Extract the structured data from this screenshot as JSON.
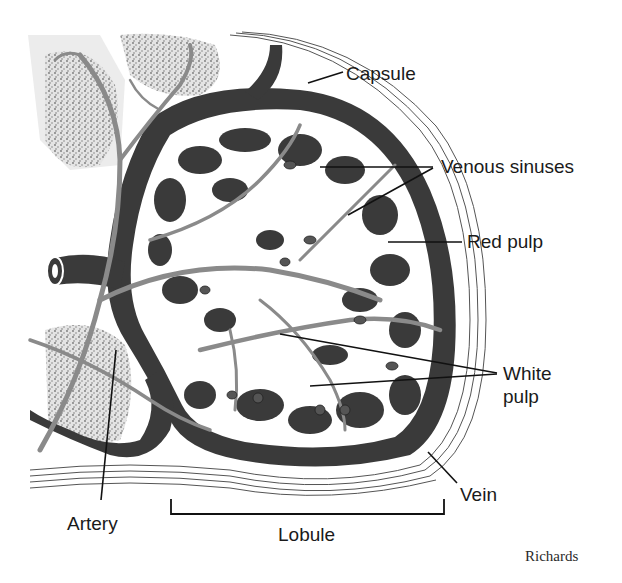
{
  "diagram": {
    "colors": {
      "vein_dark": "#3a3a3a",
      "artery_gray": "#8a8a8a",
      "white_pulp_stipple": "#b8b8b8",
      "capsule_lines": "#555555",
      "background": "#ffffff"
    },
    "labels": {
      "capsule": "Capsule",
      "venous_sinuses": "Venous sinuses",
      "red_pulp": "Red pulp",
      "white_pulp_line1": "White",
      "white_pulp_line2": "pulp",
      "vein": "Vein",
      "artery": "Artery",
      "lobule": "Lobule"
    },
    "credit": "Richards"
  }
}
